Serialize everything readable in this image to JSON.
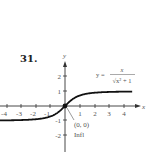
{
  "problem_number": "31.",
  "equation": {
    "lhs": "y =",
    "numerator": "x",
    "denominator": "√x² + 1"
  },
  "point_label": "(0, 0)",
  "point_note": "Infl",
  "chart_data": {
    "type": "line",
    "title": "",
    "function": "y = x / sqrt(x^2 + 1)",
    "xlabel": "x",
    "ylabel": "y",
    "x_ticks": [
      "-4",
      "-3",
      "-2",
      "-1",
      "1",
      "2",
      "3",
      "4"
    ],
    "y_ticks": [
      "2",
      "1",
      "-1",
      "-2"
    ],
    "xlim": [
      -4.5,
      5
    ],
    "ylim": [
      -3,
      3
    ],
    "grid": false,
    "annotations": [
      {
        "x": 0,
        "y": 0,
        "label": "(0, 0)",
        "note": "Infl"
      }
    ],
    "x": [
      -4.5,
      -4,
      -3,
      -2,
      -1,
      0,
      1,
      2,
      3,
      4,
      4.6
    ],
    "y": [
      -0.976,
      -0.97,
      -0.949,
      -0.894,
      -0.707,
      0,
      0.707,
      0.894,
      0.949,
      0.97,
      0.977
    ]
  }
}
